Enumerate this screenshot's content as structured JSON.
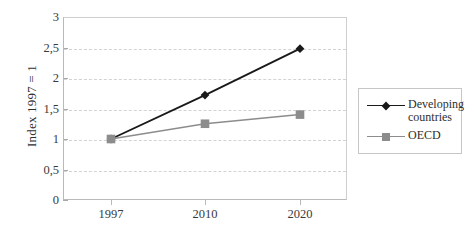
{
  "chart_data": {
    "type": "line",
    "title": "",
    "xlabel": "",
    "ylabel": "Index 1997 = 1",
    "categories": [
      "1997",
      "2010",
      "2020"
    ],
    "x_tick_labels": [
      "1997",
      "2010",
      "2020"
    ],
    "y_tick_labels": [
      "0",
      "0,5",
      "1",
      "1,5",
      "2",
      "2,5",
      "3"
    ],
    "y_tick_values": [
      0,
      0.5,
      1,
      1.5,
      2,
      2.5,
      3
    ],
    "ylim": [
      0,
      3
    ],
    "grid": "horizontal-dashed",
    "legend_position": "right",
    "decimal_separator": ",",
    "series": [
      {
        "name": "Developing\ncountries",
        "name_flat": "Developing countries",
        "values": [
          1.0,
          1.72,
          2.48
        ],
        "color": "#1a1a1a",
        "marker": "diamond"
      },
      {
        "name": "OECD",
        "name_flat": "OECD",
        "values": [
          1.0,
          1.25,
          1.4
        ],
        "color": "#8c8c8c",
        "marker": "square"
      }
    ]
  },
  "axis": {
    "y_title": "Index 1997 = 1",
    "y_labels": [
      "3",
      "2,5",
      "2",
      "1,5",
      "1",
      "0,5",
      "0"
    ],
    "x_labels": [
      "1997",
      "2010",
      "2020"
    ]
  },
  "legend": {
    "entries": [
      {
        "label": "Developing\ncountries",
        "color": "#1a1a1a",
        "marker": "diamond"
      },
      {
        "label": "OECD",
        "color": "#8c8c8c",
        "marker": "square"
      }
    ]
  },
  "colors": {
    "developing": "#1a1a1a",
    "oecd": "#8c8c8c",
    "gridline": "#d3d3d3",
    "axis": "#b9b9b9",
    "background": "#ffffff"
  }
}
